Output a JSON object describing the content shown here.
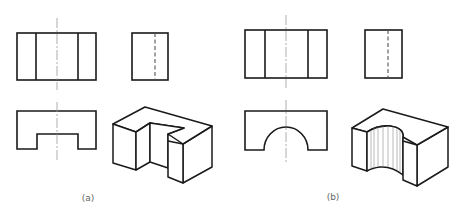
{
  "figure": {
    "panels": [
      {
        "id": "a",
        "caption": "(a)",
        "description": "Three orthographic views and isometric view of a block with a rectangular slot",
        "views": [
          "front-view",
          "side-view",
          "top-view",
          "isometric-view"
        ],
        "cutout_shape": "rectangular"
      },
      {
        "id": "b",
        "caption": "(b)",
        "description": "Three orthographic views and isometric view of a block with a semicircular slot",
        "views": [
          "front-view",
          "side-view",
          "top-view",
          "isometric-view"
        ],
        "cutout_shape": "semicircular"
      }
    ],
    "colors": {
      "line": "#1a1a1a",
      "centerline": "#9a9a9a",
      "hidden_line": "#555555",
      "caption": "#666666",
      "background": "#ffffff"
    }
  }
}
